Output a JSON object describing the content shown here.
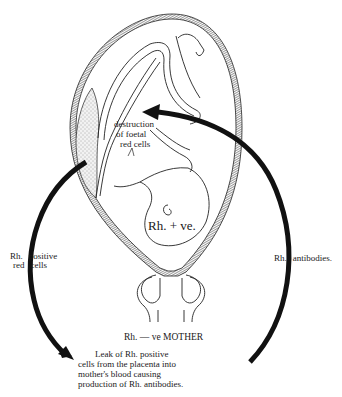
{
  "figure": {
    "type": "diagram"
  },
  "labels": {
    "fetal_destruction": [
      "destruction",
      "of foetal",
      "red cells"
    ],
    "fetus_rh": "Rh. + ve.",
    "left_arrow_label_line1_a": "Rh.",
    "left_arrow_label_line1_b": "positive",
    "left_arrow_label_line2_a": "red",
    "left_arrow_label_line2_b": "cells",
    "right_arrow_label_a": "Rh.",
    "right_arrow_label_b": "antibodies.",
    "mother": "Rh. — ve MOTHER",
    "caption": [
      "Leak of Rh. positive",
      "cells from the placenta into",
      "mother's blood causing",
      "production of Rh. antibodies."
    ]
  },
  "colors": {
    "ink": "#111111",
    "wall_fill": "#7a7a7a",
    "placenta_fill": "#d8d8d8",
    "background": "#ffffff"
  }
}
